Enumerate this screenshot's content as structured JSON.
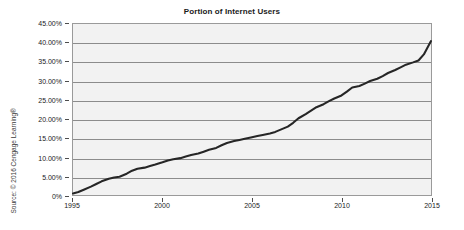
{
  "chart_data": {
    "type": "line",
    "title": "Portion of Internet Users",
    "xlabel": "",
    "ylabel": "",
    "xlim": [
      1995,
      2015
    ],
    "ylim": [
      0,
      45
    ],
    "grid": true,
    "legend": false,
    "x_tick_labels": [
      "1995",
      "2000",
      "2005",
      "2010",
      "2015"
    ],
    "x_tick_values": [
      1995,
      2000,
      2005,
      2010,
      2015
    ],
    "y_tick_labels": [
      "0%",
      "5.00%",
      "10.00%",
      "15.00%",
      "20.00%",
      "25.00%",
      "30.00%",
      "35.00%",
      "40.00%",
      "45.00%"
    ],
    "y_tick_values": [
      0,
      5,
      10,
      15,
      20,
      25,
      30,
      35,
      40,
      45
    ],
    "series": [
      {
        "name": "Portion of Internet Users",
        "color": "#262626",
        "x": [
          1995.0,
          1995.3,
          1995.6,
          1996.0,
          1996.3,
          1996.6,
          1997.0,
          1997.3,
          1997.6,
          1998.0,
          1998.3,
          1998.6,
          1999.0,
          1999.3,
          1999.6,
          2000.0,
          2000.3,
          2000.6,
          2001.0,
          2001.3,
          2001.6,
          2002.0,
          2002.3,
          2002.6,
          2003.0,
          2003.3,
          2003.6,
          2004.0,
          2004.3,
          2004.6,
          2005.0,
          2005.3,
          2005.6,
          2006.0,
          2006.3,
          2006.6,
          2007.0,
          2007.3,
          2007.6,
          2008.0,
          2008.3,
          2008.6,
          2009.0,
          2009.3,
          2009.6,
          2010.0,
          2010.3,
          2010.6,
          2011.0,
          2011.3,
          2011.6,
          2012.0,
          2012.3,
          2012.6,
          2013.0,
          2013.3,
          2013.6,
          2014.0,
          2014.3,
          2014.6,
          2015.0
        ],
        "y": [
          0.4,
          0.8,
          1.4,
          2.2,
          2.9,
          3.6,
          4.3,
          4.6,
          4.8,
          5.6,
          6.4,
          6.9,
          7.2,
          7.6,
          8.0,
          8.6,
          9.1,
          9.4,
          9.7,
          10.1,
          10.5,
          10.9,
          11.4,
          11.9,
          12.4,
          13.1,
          13.7,
          14.2,
          14.5,
          14.8,
          15.2,
          15.5,
          15.8,
          16.2,
          16.6,
          17.2,
          18.0,
          19.0,
          20.2,
          21.3,
          22.2,
          23.1,
          23.9,
          24.7,
          25.4,
          26.2,
          27.2,
          28.3,
          28.7,
          29.3,
          30.0,
          30.6,
          31.3,
          32.1,
          32.9,
          33.6,
          34.3,
          34.9,
          35.4,
          37.0,
          40.5
        ]
      }
    ],
    "source_note": "Source: © 2016 Cengage Learning®",
    "colors": {
      "plot_background": "#f2f2f2",
      "gridline": "#8c8c8c",
      "axis": "#9a9a9a",
      "line": "#262626",
      "text": "#1a1a1a"
    }
  }
}
